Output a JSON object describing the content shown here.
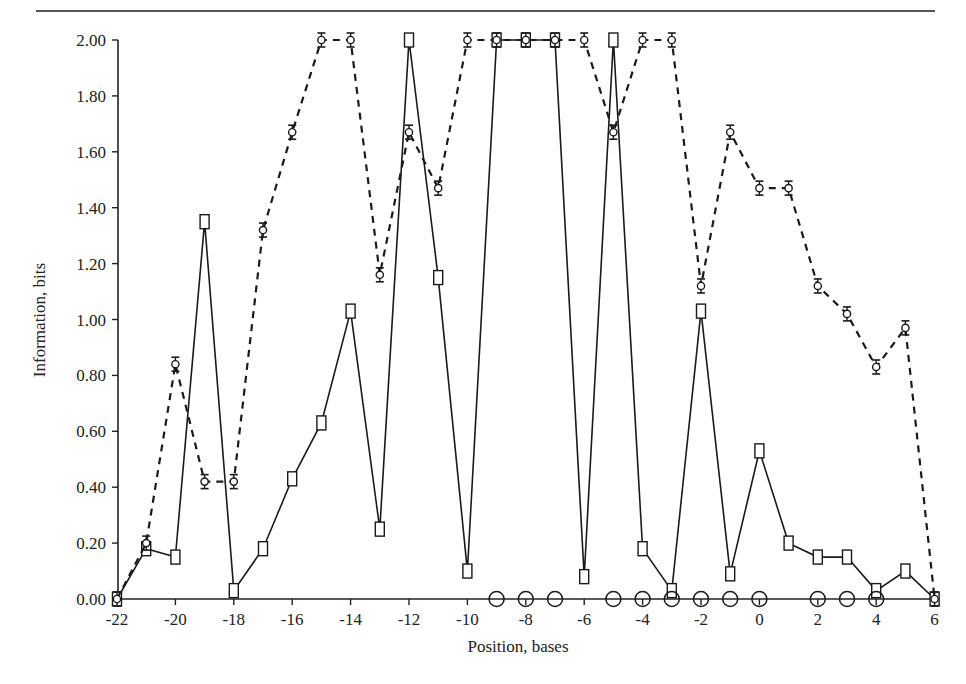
{
  "chart_data": {
    "type": "line",
    "title": "",
    "xlabel": "Position, bases",
    "ylabel": "Information, bits",
    "xlim": [
      -22,
      6
    ],
    "ylim": [
      0,
      2
    ],
    "grid": false,
    "legend": null,
    "x_ticks": [
      -22,
      -20,
      -18,
      -16,
      -14,
      -12,
      -10,
      -8,
      -6,
      -4,
      -2,
      0,
      2,
      4,
      6
    ],
    "x_tick_labels": [
      "-22",
      "-20",
      "-18",
      "-16",
      "-14",
      "-12",
      "-10",
      "-8",
      "-6",
      "-4",
      "-2",
      "0",
      "2",
      "4",
      "6"
    ],
    "y_ticks": [
      0,
      0.2,
      0.4,
      0.6,
      0.8,
      1.0,
      1.2,
      1.4,
      1.6,
      1.8,
      2.0
    ],
    "y_tick_labels": [
      "0.00",
      "0.20",
      "0.40",
      "0.60",
      "0.80",
      "1.00",
      "1.20",
      "1.40",
      "1.60",
      "1.80",
      "2.00"
    ],
    "x": [
      -22,
      -21,
      -20,
      -19,
      -18,
      -17,
      -16,
      -15,
      -14,
      -13,
      -12,
      -11,
      -10,
      -9,
      -8,
      -7,
      -6,
      -5,
      -4,
      -3,
      -2,
      -1,
      0,
      1,
      2,
      3,
      4,
      5,
      6
    ],
    "series": [
      {
        "name": "squares (solid line)",
        "marker": "square",
        "line": "solid",
        "x": [
          -22,
          -21,
          -20,
          -19,
          -18,
          -17,
          -16,
          -15,
          -14,
          -13,
          -12,
          -11,
          -10,
          -9,
          -8,
          -7,
          -6,
          -5,
          -4,
          -3,
          -2,
          -1,
          0,
          1,
          2,
          3,
          4,
          5,
          6
        ],
        "values": [
          0.0,
          0.18,
          0.15,
          1.35,
          0.03,
          0.18,
          0.43,
          0.63,
          1.03,
          0.25,
          2.0,
          1.15,
          0.1,
          2.0,
          2.0,
          2.0,
          0.08,
          2.0,
          0.18,
          0.03,
          1.03,
          0.09,
          0.53,
          0.2,
          0.15,
          0.15,
          0.03,
          0.1,
          0.0
        ]
      },
      {
        "name": "circles with error bars (dashed line)",
        "marker": "small-circle-errorbar",
        "line": "dashed",
        "x": [
          -22,
          -21,
          -20,
          -19,
          -18,
          -17,
          -16,
          -15,
          -14,
          -13,
          -12,
          -11,
          -10,
          -9,
          -8,
          -7,
          -6,
          -5,
          -4,
          -3,
          -2,
          -1,
          0,
          1,
          2,
          3,
          4,
          5,
          6
        ],
        "values": [
          0.0,
          0.2,
          0.84,
          0.42,
          0.42,
          1.32,
          1.67,
          2.0,
          2.0,
          1.16,
          1.67,
          1.47,
          2.0,
          2.0,
          2.0,
          2.0,
          2.0,
          1.67,
          2.0,
          2.0,
          1.12,
          1.67,
          1.47,
          1.47,
          1.12,
          1.02,
          0.83,
          0.97,
          0.0
        ]
      },
      {
        "name": "open circles (baseline)",
        "marker": "large-open-circle",
        "line": "none",
        "x": [
          -9,
          -8,
          -7,
          -5,
          -4,
          -3,
          -2,
          -1,
          0,
          2,
          3,
          4
        ],
        "values": [
          0,
          0,
          0,
          0,
          0,
          0,
          0,
          0,
          0,
          0,
          0,
          0
        ]
      }
    ]
  },
  "page": {
    "header_rule": true
  }
}
